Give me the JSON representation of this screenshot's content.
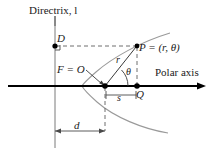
{
  "figure": {
    "colors": {
      "axis": "#000000",
      "curve": "#8c8c8c",
      "construction": "#6e6e6e",
      "dashed": "#6e6e6e",
      "text": "#1a1a1a",
      "background": "#ffffff"
    },
    "labels": {
      "directrix": "Directrix, l",
      "polar_axis": "Polar axis",
      "point_D": "D",
      "focus": "F = O",
      "point_P": "P = (r, θ)",
      "radius": "r",
      "angle": "θ",
      "point_Q": "Q",
      "segment_s": "s",
      "distance_d": "d"
    },
    "geometry": {
      "directrix_x": 55,
      "axis_y": 86,
      "focus": {
        "x": 105,
        "y": 86
      },
      "point_D": {
        "x": 55,
        "y": 46
      },
      "point_P": {
        "x": 137,
        "y": 46
      },
      "point_Q": {
        "x": 137,
        "y": 86
      },
      "vertex": {
        "x": 82,
        "y": 86
      },
      "dimension_d_y": 131,
      "curve_type": "parabola-opens-right"
    },
    "markers": {
      "right_angle_at_D": true,
      "theta_arc": true,
      "leader_arrow_from_focus_label": true
    }
  }
}
